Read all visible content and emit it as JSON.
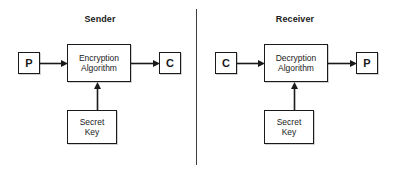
{
  "diagram": {
    "background_color": "#ffffff",
    "line_color": "#1a1a1a",
    "text_color": "#1a1a1a"
  },
  "panels": [
    {
      "id": "sender",
      "title": "Sender",
      "nodes": {
        "input": {
          "label": "P",
          "meaning": "plaintext"
        },
        "process": {
          "line1": "Encryption",
          "line2": "Algorithm"
        },
        "output": {
          "label": "C",
          "meaning": "ciphertext"
        },
        "key": {
          "line1": "Secret",
          "line2": "Key"
        }
      },
      "arrows": [
        {
          "name": "plaintext-to-encryption",
          "direction": "right"
        },
        {
          "name": "encryption-to-ciphertext",
          "direction": "right"
        },
        {
          "name": "key-to-encryption",
          "direction": "up"
        }
      ]
    },
    {
      "id": "receiver",
      "title": "Receiver",
      "nodes": {
        "input": {
          "label": "C",
          "meaning": "ciphertext"
        },
        "process": {
          "line1": "Decryption",
          "line2": "Algorithm"
        },
        "output": {
          "label": "P",
          "meaning": "plaintext"
        },
        "key": {
          "line1": "Secret",
          "line2": "Key"
        }
      },
      "arrows": [
        {
          "name": "ciphertext-to-decryption",
          "direction": "right"
        },
        {
          "name": "decryption-to-plaintext",
          "direction": "right"
        },
        {
          "name": "key-to-decryption",
          "direction": "up"
        }
      ]
    }
  ],
  "divider": {
    "name": "panel-divider",
    "orientation": "vertical"
  }
}
